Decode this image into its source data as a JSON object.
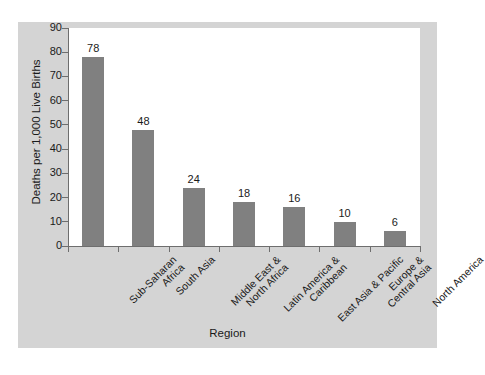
{
  "chart_data": {
    "type": "bar",
    "title": "",
    "xlabel": "Region",
    "ylabel": "Deaths per 1,000 Live Births",
    "categories": [
      "Sub-Saharan Africa",
      "South Asia",
      "Middle East & North Africa",
      "Latin America & Caribbean",
      "East Asia & Pacific",
      "Europe & Central Asia",
      "North America"
    ],
    "category_lines": [
      [
        "Sub-Saharan",
        "Africa"
      ],
      [
        "South Asia"
      ],
      [
        "Middle East &",
        "North Africa"
      ],
      [
        "Latin America &",
        "Caribbean"
      ],
      [
        "East Asia & Pacific"
      ],
      [
        "Europe &",
        "Central Asia"
      ],
      [
        "North America"
      ]
    ],
    "values": [
      78,
      48,
      24,
      18,
      16,
      10,
      6
    ],
    "ylim": [
      0,
      90
    ],
    "ytick_step": 10,
    "yticks": [
      "90",
      "80",
      "70",
      "60",
      "50",
      "40",
      "30",
      "20",
      "10",
      "0"
    ],
    "grid": false,
    "legend": false,
    "bar_color": "#808080",
    "panel_color": "#d4d4d4",
    "plot_color": "#ffffff",
    "axis_color": "#6e6e6e",
    "text_color": "#1a1a1a"
  }
}
